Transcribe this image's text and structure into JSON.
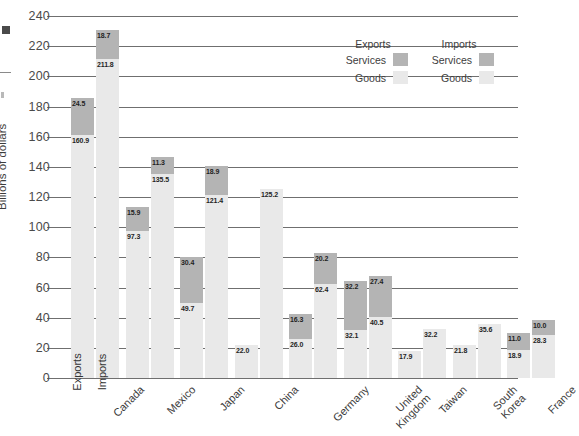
{
  "chart_data": {
    "type": "bar",
    "title": "",
    "subtitle": "",
    "xlabel": "",
    "ylabel": "Billions of dollars",
    "ylim": [
      0,
      240
    ],
    "ytick_step": 20,
    "yticks": [
      0,
      20,
      40,
      60,
      80,
      100,
      120,
      140,
      160,
      180,
      200,
      220,
      240
    ],
    "grid": true,
    "stacked": true,
    "legend_position": "top-right",
    "categories": [
      "Canada",
      "Mexico",
      "Japan",
      "China",
      "Germany",
      "United Kingdom",
      "Taiwan",
      "South Korea",
      "France"
    ],
    "category_lines": [
      [
        "Canada"
      ],
      [
        "Mexico"
      ],
      [
        "Japan"
      ],
      [
        "China"
      ],
      [
        "Germany"
      ],
      [
        "United",
        "Kingdom"
      ],
      [
        "Taiwan"
      ],
      [
        "South",
        "Korea"
      ],
      [
        "France"
      ]
    ],
    "series": [
      {
        "name": "Exports Goods",
        "group": "Exports",
        "component": "Goods",
        "color": "#e9e9e9",
        "values": [
          160.9,
          97.3,
          49.7,
          22.0,
          26.0,
          32.1,
          17.9,
          21.8,
          18.9
        ]
      },
      {
        "name": "Exports Services",
        "group": "Exports",
        "component": "Services",
        "color": "#b4b4b4",
        "values": [
          24.5,
          15.9,
          30.4,
          null,
          16.3,
          32.2,
          null,
          null,
          11.0
        ]
      },
      {
        "name": "Imports Goods",
        "group": "Imports",
        "component": "Goods",
        "color": "#e9e9e9",
        "values": [
          211.8,
          135.5,
          121.4,
          125.2,
          62.4,
          40.5,
          32.2,
          35.6,
          28.3
        ]
      },
      {
        "name": "Imports Services",
        "group": "Imports",
        "component": "Services",
        "color": "#b4b4b4",
        "values": [
          18.7,
          11.3,
          18.9,
          null,
          20.2,
          27.4,
          null,
          null,
          10.0
        ]
      }
    ],
    "bar_labels": {
      "Canada": {
        "exports_goods": "160.9",
        "exports_services": "24.5",
        "imports_goods": "211.8",
        "imports_services": "18.7"
      },
      "Mexico": {
        "exports_goods": "97.3",
        "exports_services": "15.9",
        "imports_goods": "135.5",
        "imports_services": "11.3"
      },
      "Japan": {
        "exports_goods": "49.7",
        "exports_services": "30.4",
        "imports_goods": "121.4",
        "imports_services": "18.9"
      },
      "China": {
        "exports_goods": "22.0",
        "exports_services": "",
        "imports_goods": "125.2",
        "imports_services": ""
      },
      "Germany": {
        "exports_goods": "26.0",
        "exports_services": "16.3",
        "imports_goods": "62.4",
        "imports_services": "20.2"
      },
      "United Kingdom": {
        "exports_goods": "32.1",
        "exports_services": "32.2",
        "imports_goods": "40.5",
        "imports_services": "27.4"
      },
      "Taiwan": {
        "exports_goods": "17.9",
        "exports_services": "",
        "imports_goods": "32.2",
        "imports_services": ""
      },
      "South Korea": {
        "exports_goods": "21.8",
        "exports_services": "",
        "imports_goods": "35.6",
        "imports_services": ""
      },
      "France": {
        "exports_goods": "18.9",
        "exports_services": "11.0",
        "imports_goods": "28.3",
        "imports_services": "10.0"
      }
    },
    "annotations": {
      "exports_bar_inline": "Exports",
      "imports_bar_inline": "Imports"
    }
  },
  "legend": {
    "heading_exports": "Exports",
    "heading_imports": "Imports",
    "row_services": "Services",
    "row_goods": "Goods",
    "color_services": "#b4b4b4",
    "color_goods": "#e9e9e9"
  },
  "axis": {
    "y_title": "Billions of dollars",
    "y_ticks": [
      "240",
      "220",
      "200",
      "180",
      "160",
      "140",
      "120",
      "100",
      "80",
      "60",
      "40",
      "20",
      "0"
    ]
  }
}
